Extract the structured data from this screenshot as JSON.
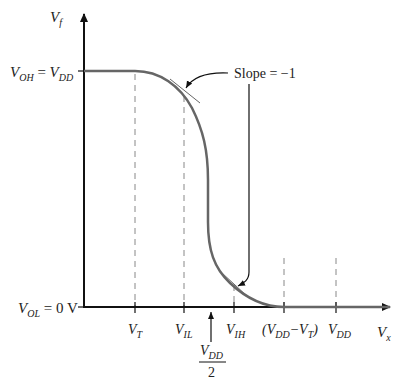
{
  "figure": {
    "y_axis_label": "V",
    "y_axis_sub": "f",
    "x_axis_label": "V",
    "x_axis_sub": "x",
    "voh_label": {
      "v1": "V",
      "s1": "OH",
      "eq": " = ",
      "v2": "V",
      "s2": "DD"
    },
    "vol_label": {
      "v1": "V",
      "s1": "OL",
      "eq": " = 0 V"
    },
    "annotation": "Slope = −1",
    "x_ticks": [
      {
        "main": "V",
        "sub": "T"
      },
      {
        "main": "V",
        "sub": "IL"
      },
      {
        "main": "V",
        "sub": "IH"
      },
      {
        "pre": "(V",
        "sub": "DD",
        "mid": "−V",
        "sub2": "T",
        "post": ")"
      },
      {
        "main": "V",
        "sub": "DD"
      }
    ],
    "midpoint_label": {
      "num_main": "V",
      "num_sub": "DD",
      "den": "2"
    },
    "colors": {
      "curve": "#666666",
      "axis": "#111111",
      "dash": "#888888",
      "text": "#222222"
    }
  }
}
